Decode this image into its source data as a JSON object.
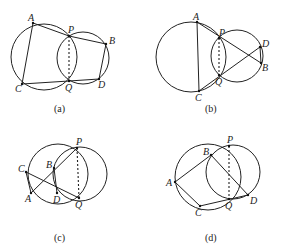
{
  "figures": [
    {
      "caption": "(a)",
      "circles": [
        {
          "cx": 44,
          "cy": 57,
          "r": 33
        },
        {
          "cx": 83,
          "cy": 58,
          "r": 26
        }
      ],
      "points": {
        "A": [
          33,
          23
        ],
        "P": [
          69,
          36
        ],
        "B": [
          106,
          44
        ],
        "D": [
          99,
          79
        ],
        "Q": [
          69,
          81
        ],
        "C": [
          22,
          84
        ]
      },
      "labels": {
        "A": "A",
        "P": "P",
        "B": "B",
        "D": "D",
        "Q": "Q",
        "C": "C"
      },
      "segments": [
        [
          "A",
          "C"
        ],
        [
          "C",
          "Q"
        ],
        [
          "Q",
          "D"
        ],
        [
          "D",
          "B"
        ],
        [
          "B",
          "P"
        ],
        [
          "P",
          "A"
        ]
      ],
      "dashed": [
        [
          "P",
          "Q"
        ]
      ]
    },
    {
      "caption": "(b)",
      "circles": [
        {
          "cx": 191,
          "cy": 57,
          "r": 35
        },
        {
          "cx": 237,
          "cy": 56,
          "r": 26
        }
      ],
      "points": {
        "A": [
          197,
          22
        ],
        "P": [
          219,
          38
        ],
        "D": [
          260,
          47
        ],
        "B": [
          261,
          63
        ],
        "Q": [
          219,
          75
        ],
        "C": [
          199,
          91
        ]
      },
      "labels": {
        "A": "A",
        "P": "P",
        "D": "D",
        "B": "B",
        "Q": "Q",
        "C": "C"
      },
      "segments": [
        [
          "A",
          "C"
        ],
        [
          "A",
          "B"
        ],
        [
          "C",
          "D"
        ],
        [
          "D",
          "B"
        ]
      ],
      "dashed": [
        [
          "P",
          "Q"
        ]
      ]
    },
    {
      "caption": "(c)",
      "circles": [
        {
          "cx": 58,
          "cy": 174,
          "r": 30
        },
        {
          "cx": 80,
          "cy": 174,
          "r": 27
        }
      ],
      "points": {
        "P": [
          77,
          148
        ],
        "B": [
          54,
          168
        ],
        "C": [
          26,
          172
        ],
        "A": [
          31,
          193
        ],
        "D": [
          57,
          193
        ],
        "Q": [
          79,
          198
        ]
      },
      "labels": {
        "P": "P",
        "B": "B",
        "C": "C",
        "A": "A",
        "D": "D",
        "Q": "Q"
      },
      "segments": [
        [
          "P",
          "A"
        ],
        [
          "C",
          "Q"
        ],
        [
          "C",
          "A"
        ],
        [
          "B",
          "D"
        ]
      ],
      "dashed": [
        [
          "P",
          "Q"
        ]
      ]
    },
    {
      "caption": "(d)",
      "circles": [
        {
          "cx": 208,
          "cy": 177,
          "r": 33
        },
        {
          "cx": 233,
          "cy": 172,
          "r": 27
        }
      ],
      "points": {
        "P": [
          229,
          146
        ],
        "B": [
          211,
          155
        ],
        "A": [
          175,
          182
        ],
        "C": [
          200,
          206
        ],
        "Q": [
          229,
          199
        ],
        "D": [
          248,
          195
        ]
      },
      "labels": {
        "P": "P",
        "B": "B",
        "A": "A",
        "C": "C",
        "Q": "Q",
        "D": "D"
      },
      "segments": [
        [
          "A",
          "B"
        ],
        [
          "B",
          "D"
        ],
        [
          "A",
          "C"
        ],
        [
          "C",
          "D"
        ]
      ],
      "dashed": [
        [
          "P",
          "Q"
        ]
      ]
    }
  ]
}
